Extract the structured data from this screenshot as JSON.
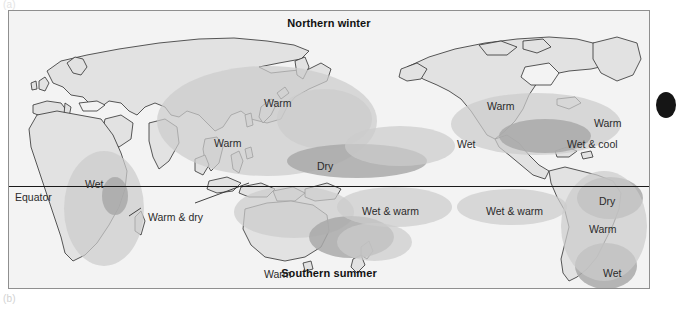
{
  "figure": {
    "panel_top_label": "(a)",
    "panel_bottom_label": "(b)"
  },
  "map": {
    "title_top": "Northern winter",
    "title_bottom": "Southern summer",
    "equator_label": "Equator",
    "background_color": "#f3f3f3",
    "land_color": "#e0e0e0",
    "coast_color": "#2f2f2f",
    "shade_light_color": "#cccccc",
    "shade_dark_color": "#a9a9a9",
    "frame_color": "#8f8f8f"
  },
  "climate_labels": [
    {
      "id": "warm-e-asia",
      "text": "Warm",
      "x": 255,
      "y": 87
    },
    {
      "id": "warm-s-asia",
      "text": "Warm",
      "x": 205,
      "y": 127
    },
    {
      "id": "dry-w-pacific",
      "text": "Dry",
      "x": 308,
      "y": 150
    },
    {
      "id": "wet-africa",
      "text": "Wet",
      "x": 76,
      "y": 168
    },
    {
      "id": "warm-and-dry",
      "text": "Warm & dry",
      "x": 139,
      "y": 201
    },
    {
      "id": "wet-warm-pacific",
      "text": "Wet & warm",
      "x": 353,
      "y": 195
    },
    {
      "id": "warm-australia",
      "text": "Warm",
      "x": 255,
      "y": 258
    },
    {
      "id": "wet-nw-america",
      "text": "Wet",
      "x": 448,
      "y": 128
    },
    {
      "id": "warm-n-america",
      "text": "Warm",
      "x": 478,
      "y": 90
    },
    {
      "id": "warm-ne-america",
      "text": "Warm",
      "x": 585,
      "y": 107
    },
    {
      "id": "wet-cool-se-usa",
      "text": "Wet & cool",
      "x": 558,
      "y": 128
    },
    {
      "id": "wet-warm-e-pac",
      "text": "Wet & warm",
      "x": 477,
      "y": 195
    },
    {
      "id": "dry-s-america",
      "text": "Dry",
      "x": 590,
      "y": 185
    },
    {
      "id": "warm-s-america",
      "text": "Warm",
      "x": 580,
      "y": 213
    },
    {
      "id": "wet-se-s-america",
      "text": "Wet",
      "x": 594,
      "y": 257
    }
  ],
  "shaded_regions": [
    {
      "id": "shade-india-asia",
      "tone": "light",
      "x": 148,
      "y": 55,
      "w": 220,
      "h": 110
    },
    {
      "id": "shade-e-asia",
      "tone": "light",
      "x": 268,
      "y": 78,
      "w": 95,
      "h": 60
    },
    {
      "id": "shade-africa-wet",
      "tone": "light",
      "x": 55,
      "y": 140,
      "w": 80,
      "h": 115
    },
    {
      "id": "shade-africa-core",
      "tone": "dark",
      "x": 93,
      "y": 166,
      "w": 26,
      "h": 38
    },
    {
      "id": "shade-indonesia",
      "tone": "light",
      "x": 225,
      "y": 175,
      "w": 120,
      "h": 52
    },
    {
      "id": "shade-w-pacific",
      "tone": "dark",
      "x": 278,
      "y": 133,
      "w": 140,
      "h": 34
    },
    {
      "id": "shade-coral-sea",
      "tone": "dark",
      "x": 300,
      "y": 205,
      "w": 85,
      "h": 42
    },
    {
      "id": "shade-pacific-band",
      "tone": "light",
      "x": 328,
      "y": 176,
      "w": 115,
      "h": 40
    },
    {
      "id": "shade-hawaii",
      "tone": "light",
      "x": 336,
      "y": 115,
      "w": 110,
      "h": 40
    },
    {
      "id": "shade-nz-band",
      "tone": "light",
      "x": 328,
      "y": 212,
      "w": 75,
      "h": 38
    },
    {
      "id": "shade-n-america",
      "tone": "light",
      "x": 442,
      "y": 82,
      "w": 170,
      "h": 62
    },
    {
      "id": "shade-mexico",
      "tone": "dark",
      "x": 490,
      "y": 108,
      "w": 92,
      "h": 34
    },
    {
      "id": "shade-e-pacific",
      "tone": "light",
      "x": 448,
      "y": 178,
      "w": 110,
      "h": 36
    },
    {
      "id": "shade-s-america-dry",
      "tone": "dark",
      "x": 568,
      "y": 166,
      "w": 66,
      "h": 42
    },
    {
      "id": "shade-s-america-wet",
      "tone": "dark",
      "x": 566,
      "y": 232,
      "w": 62,
      "h": 46
    },
    {
      "id": "shade-s-america-mid",
      "tone": "light",
      "x": 552,
      "y": 160,
      "w": 86,
      "h": 110
    }
  ],
  "page_marker": {
    "id": "page-edge-marker",
    "color": "#151515"
  }
}
